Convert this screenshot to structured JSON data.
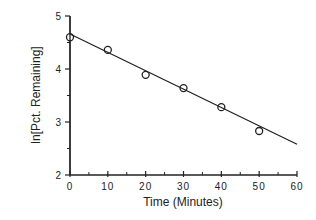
{
  "chart_data": {
    "type": "scatter",
    "title": "",
    "xlabel": "Time (Minutes)",
    "ylabel": "ln[Pct. Remaining]",
    "xlim": [
      0,
      60
    ],
    "ylim": [
      2,
      5
    ],
    "x_ticks": [
      0,
      10,
      20,
      30,
      40,
      50,
      60
    ],
    "x_tick_labels": [
      "0",
      "10",
      "20",
      "30",
      "40",
      "50",
      "60"
    ],
    "y_ticks": [
      2,
      3,
      4,
      5
    ],
    "y_tick_labels": [
      "2",
      "3",
      "4",
      "5"
    ],
    "x_minor_step": 5,
    "y_minor_step": 0.5,
    "grid": false,
    "legend": null,
    "series": [
      {
        "name": "Observed",
        "marker": "open-circle",
        "x": [
          0,
          10,
          20,
          30,
          40,
          50
        ],
        "y": [
          4.6,
          4.36,
          3.89,
          3.64,
          3.28,
          2.83
        ]
      },
      {
        "name": "Linear fit",
        "marker": "line",
        "x": [
          0,
          60
        ],
        "y": [
          4.66,
          2.58
        ]
      }
    ],
    "colors": {
      "axis": "#222222",
      "series": "#222222"
    }
  }
}
